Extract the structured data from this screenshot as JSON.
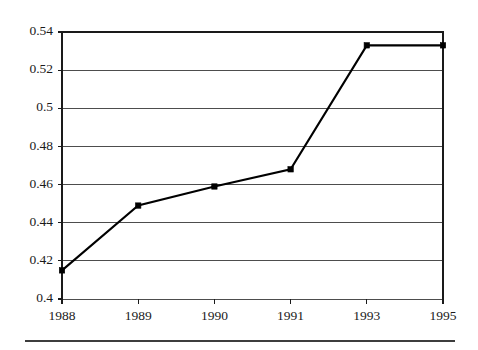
{
  "chart_data": {
    "type": "line",
    "title": "",
    "subtitle": "",
    "xlabel": "",
    "ylabel": "",
    "categories": [
      "1988",
      "1989",
      "1990",
      "1991",
      "1993",
      "1995"
    ],
    "series": [
      {
        "name": "series-1",
        "values": [
          0.415,
          0.449,
          0.459,
          0.468,
          0.533,
          0.533
        ],
        "color": "#000000",
        "marker": "filled-square"
      }
    ],
    "ylim": [
      0.4,
      0.54
    ],
    "ytick_values": [
      0.4,
      0.42,
      0.44,
      0.46,
      0.48,
      0.5,
      0.52,
      0.54
    ],
    "ytick_labels": [
      "0.4",
      "0.42",
      "0.44",
      "0.46",
      "0.48",
      "0.5",
      "0.52",
      "0.54"
    ],
    "xtick_labels": [
      "1988",
      "1989",
      "1990",
      "1991",
      "1993",
      "1995"
    ],
    "grid": "horizontal",
    "legend": "none",
    "annotations": []
  },
  "colors": {
    "line": "#000000",
    "marker": "#000000",
    "grid": "#4d4d4d",
    "axis": "#1a1a1a",
    "text": "#1a1a1a",
    "background": "#ffffff",
    "footer_rule": "#3d3d3d"
  },
  "geometry": {
    "plot_left": 62,
    "plot_right": 443,
    "plot_top": 32,
    "plot_bottom": 299,
    "footer_rule_y": 341,
    "footer_rule_x1": 25,
    "footer_rule_x2": 455
  }
}
